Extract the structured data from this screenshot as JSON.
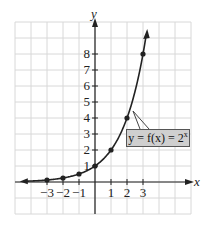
{
  "chart_data": {
    "type": "line",
    "title": "",
    "xlabel": "x",
    "ylabel": "y",
    "function": "y = f(x) = 2^x",
    "x": [
      -3,
      -2,
      -1,
      0,
      1,
      2,
      3
    ],
    "series": [
      {
        "name": "y = f(x) = 2^x",
        "values": [
          0.125,
          0.25,
          0.5,
          1,
          2,
          4,
          8
        ]
      }
    ],
    "x_ticks": [
      "-3",
      "-2",
      "-1",
      "1",
      "2",
      "3"
    ],
    "y_ticks": [
      "1",
      "2",
      "3",
      "4",
      "5",
      "6",
      "7",
      "8"
    ],
    "xlim": [
      -5,
      6
    ],
    "ylim": [
      -2,
      10
    ],
    "grid": true,
    "annotation": "y = f(x) = 2^x"
  },
  "labels": {
    "x_axis": "x",
    "y_axis": "y",
    "curve_label_prefix": "y = f(x) = 2",
    "curve_label_exp": "x"
  },
  "colors": {
    "grid": "#d8d8d8",
    "axis": "#222222",
    "curve": "#222222",
    "label_box": "#cfcfcf"
  }
}
